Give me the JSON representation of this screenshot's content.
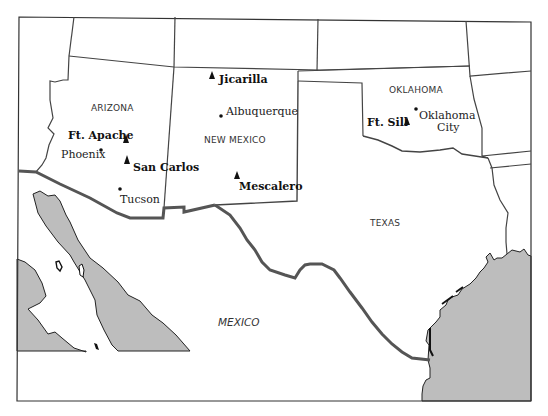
{
  "map": {
    "colors": {
      "land": "#ffffff",
      "water": "#bdbdbd",
      "border": "#444444",
      "international_border": "#555555"
    },
    "regions": {
      "arizona": "ARIZONA",
      "new_mexico": "NEW MEXICO",
      "oklahoma": "OKLAHOMA",
      "texas": "TEXAS",
      "mexico": "MEXICO"
    },
    "cities": [
      {
        "name": "Albuquerque"
      },
      {
        "name": "Phoenix"
      },
      {
        "name": "Tucson"
      },
      {
        "name": "Oklahoma City",
        "line1": "Oklahoma",
        "line2": "City"
      }
    ],
    "reservations": [
      {
        "name": "Jicarilla"
      },
      {
        "name": "Ft. Apache"
      },
      {
        "name": "San Carlos"
      },
      {
        "name": "Mescalero"
      },
      {
        "name": "Ft. Sill"
      }
    ],
    "legend_symbols": {
      "city": "dot",
      "reservation": "triangle"
    }
  }
}
